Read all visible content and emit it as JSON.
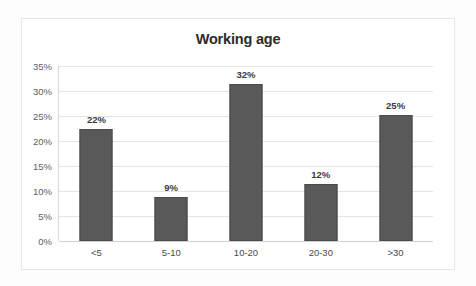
{
  "chart_data": {
    "type": "bar",
    "title": "Working age",
    "xlabel": "",
    "ylabel": "",
    "categories": [
      "<5",
      "5-10",
      "10-20",
      "20-30",
      ">30"
    ],
    "values": [
      22,
      9,
      32,
      12,
      25
    ],
    "bar_pixel_values": [
      22.5,
      8.8,
      31.5,
      11.5,
      25.2
    ],
    "data_labels": [
      "22%",
      "9%",
      "32%",
      "12%",
      "25%"
    ],
    "ylim": [
      0,
      35
    ],
    "ytick_values": [
      0,
      5,
      10,
      15,
      20,
      25,
      30,
      35
    ],
    "ytick_labels": [
      "0%",
      "5%",
      "10%",
      "15%",
      "20%",
      "25%",
      "30%",
      "35%"
    ],
    "grid": true,
    "legend": false,
    "legend_position": "none",
    "series": [
      {
        "name": "Working age",
        "values": [
          22,
          9,
          32,
          12,
          25
        ]
      }
    ],
    "colors": {
      "bar_fill": "#595959",
      "bar_border": "#4a4a4a",
      "gridline": "#e4e4e4",
      "baseline": "#d2d2d2",
      "title_text": "#2b2b2b",
      "tick_text": "#5e5e5e",
      "label_text": "#3a3a3a",
      "frame_border": "#e6e6e6",
      "plot_background": "#ffffff",
      "page_background": "#fdfdfd"
    }
  }
}
